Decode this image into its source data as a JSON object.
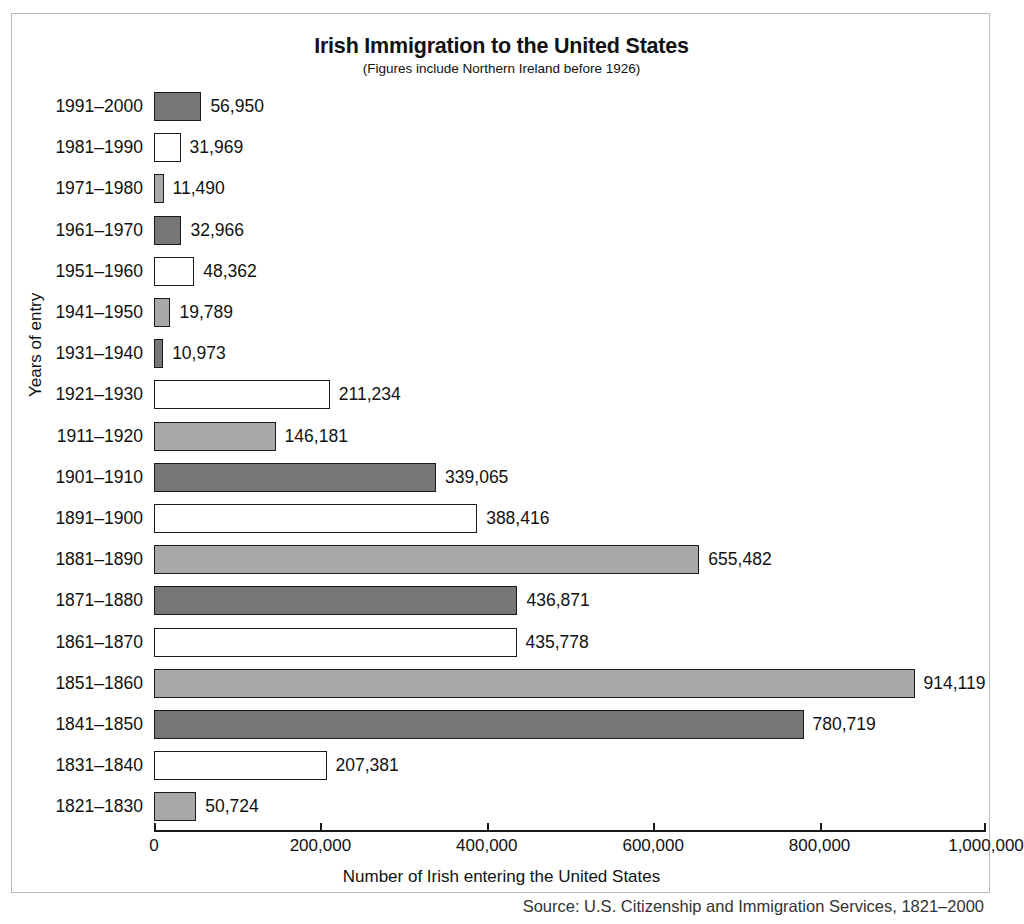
{
  "chart_data": {
    "type": "bar",
    "orientation": "horizontal",
    "title": "Irish Immigration to the United States",
    "subtitle": "(Figures include Northern Ireland before 1926)",
    "xlabel": "Number of Irish entering the United States",
    "ylabel": "Years of entry",
    "xlim": [
      0,
      1000000
    ],
    "grid": false,
    "legend": "none",
    "xticks": [
      0,
      200000,
      400000,
      600000,
      800000,
      1000000
    ],
    "xticklabels": [
      "0",
      "200,000",
      "400,000",
      "600,000",
      "800,000",
      "1,000,000"
    ],
    "categories": [
      "1991–2000",
      "1981–1990",
      "1971–1980",
      "1961–1970",
      "1951–1960",
      "1941–1950",
      "1931–1940",
      "1921–1930",
      "1911–1920",
      "1901–1910",
      "1891–1900",
      "1881–1890",
      "1871–1880",
      "1861–1870",
      "1851–1860",
      "1841–1850",
      "1831–1840",
      "1821–1830"
    ],
    "values": [
      56950,
      31969,
      11490,
      32966,
      48362,
      19789,
      10973,
      211234,
      146181,
      339065,
      388416,
      655482,
      436871,
      435778,
      914119,
      780719,
      207381,
      50724
    ],
    "value_labels": [
      "56,950",
      "31,969",
      "11,490",
      "32,966",
      "48,362",
      "19,789",
      "10,973",
      "211,234",
      "146,181",
      "339,065",
      "388,416",
      "655,482",
      "436,871",
      "435,778",
      "914,119",
      "780,719",
      "207,381",
      "50,724"
    ],
    "fills": [
      "dark",
      "white",
      "light",
      "dark",
      "white",
      "light",
      "dark",
      "white",
      "light",
      "dark",
      "white",
      "light",
      "dark",
      "white",
      "light",
      "dark",
      "white",
      "light"
    ],
    "colors": {
      "dark": "#767676",
      "light": "#a8a8a8",
      "white": "#ffffff",
      "outline": "#1a1a1a"
    }
  },
  "source": {
    "text": "Source: U.S. Citizenship and Immigration Services, 1821–2000"
  }
}
